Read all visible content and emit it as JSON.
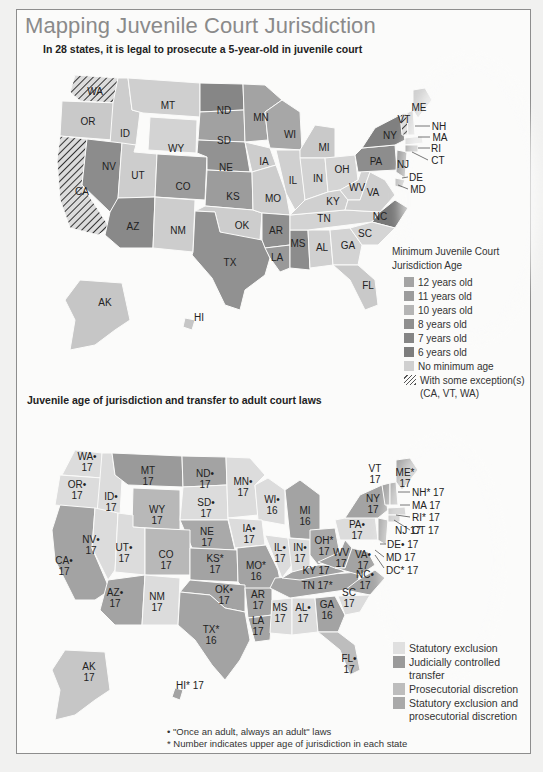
{
  "title": "Mapping Juvenile Court Jurisdiction",
  "map1": {
    "subtitle": "In 28 states, it is legal to prosecute a 5-year-old in juvenile court",
    "legend": {
      "title_line1": "Minimum Juvenile Court",
      "title_line2": "Jurisdiction Age",
      "items": [
        {
          "label": "12 years old",
          "color": "#a4a4a4"
        },
        {
          "label": "11 years old",
          "color": "#9c9c9c"
        },
        {
          "label": "10 years old",
          "color": "#b5b5b5"
        },
        {
          "label": "8 years old",
          "color": "#8f8f8f"
        },
        {
          "label": "7 years old",
          "color": "#858585"
        },
        {
          "label": "6 years old",
          "color": "#7d7d7d"
        },
        {
          "label": "No minimum age",
          "color": "#d0d0d0"
        }
      ],
      "hatch_label": "With some exception(s)",
      "hatch_sub": "(CA, VT, WA)"
    },
    "states": [
      {
        "abbr": "WA",
        "x": 95,
        "y": 91
      },
      {
        "abbr": "OR",
        "x": 88,
        "y": 121
      },
      {
        "abbr": "ID",
        "x": 125,
        "y": 133
      },
      {
        "abbr": "MT",
        "x": 168,
        "y": 105
      },
      {
        "abbr": "WY",
        "x": 176,
        "y": 148
      },
      {
        "abbr": "ND",
        "x": 224,
        "y": 110
      },
      {
        "abbr": "SD",
        "x": 224,
        "y": 140
      },
      {
        "abbr": "NE",
        "x": 226,
        "y": 167
      },
      {
        "abbr": "MN",
        "x": 261,
        "y": 117
      },
      {
        "abbr": "WI",
        "x": 290,
        "y": 134
      },
      {
        "abbr": "IA",
        "x": 264,
        "y": 161
      },
      {
        "abbr": "IL",
        "x": 293,
        "y": 180
      },
      {
        "abbr": "MI",
        "x": 324,
        "y": 147
      },
      {
        "abbr": "IN",
        "x": 318,
        "y": 178
      },
      {
        "abbr": "OH",
        "x": 342,
        "y": 169
      },
      {
        "abbr": "NV",
        "x": 109,
        "y": 166
      },
      {
        "abbr": "UT",
        "x": 138,
        "y": 175
      },
      {
        "abbr": "CO",
        "x": 183,
        "y": 186
      },
      {
        "abbr": "KS",
        "x": 233,
        "y": 196
      },
      {
        "abbr": "MO",
        "x": 273,
        "y": 198
      },
      {
        "abbr": "CA",
        "x": 82,
        "y": 191
      },
      {
        "abbr": "AZ",
        "x": 133,
        "y": 226
      },
      {
        "abbr": "NM",
        "x": 178,
        "y": 230
      },
      {
        "abbr": "OK",
        "x": 242,
        "y": 225
      },
      {
        "abbr": "AR",
        "x": 276,
        "y": 230
      },
      {
        "abbr": "TX",
        "x": 230,
        "y": 262
      },
      {
        "abbr": "LA",
        "x": 277,
        "y": 257
      },
      {
        "abbr": "MS",
        "x": 298,
        "y": 243
      },
      {
        "abbr": "AL",
        "x": 322,
        "y": 247
      },
      {
        "abbr": "GA",
        "x": 348,
        "y": 245
      },
      {
        "abbr": "TN",
        "x": 324,
        "y": 218
      },
      {
        "abbr": "KY",
        "x": 333,
        "y": 201
      },
      {
        "abbr": "WV",
        "x": 357,
        "y": 187
      },
      {
        "abbr": "VA",
        "x": 373,
        "y": 192
      },
      {
        "abbr": "NC",
        "x": 380,
        "y": 216
      },
      {
        "abbr": "SC",
        "x": 365,
        "y": 233
      },
      {
        "abbr": "FL",
        "x": 368,
        "y": 285
      },
      {
        "abbr": "PA",
        "x": 376,
        "y": 161
      },
      {
        "abbr": "NY",
        "x": 390,
        "y": 135
      },
      {
        "abbr": "NJ",
        "x": 403,
        "y": 164
      },
      {
        "abbr": "ME",
        "x": 419,
        "y": 107
      },
      {
        "abbr": "VT",
        "x": 404,
        "y": 119
      },
      {
        "abbr": "NH",
        "x": 437,
        "y": 126
      },
      {
        "abbr": "MA",
        "x": 438,
        "y": 137
      },
      {
        "abbr": "RI",
        "x": 436,
        "y": 148
      },
      {
        "abbr": "CT",
        "x": 437,
        "y": 160
      },
      {
        "abbr": "DE",
        "x": 416,
        "y": 177
      },
      {
        "abbr": "MD",
        "x": 417,
        "y": 189
      },
      {
        "abbr": "AK",
        "x": 105,
        "y": 302
      },
      {
        "abbr": "HI",
        "x": 199,
        "y": 317
      }
    ]
  },
  "map2": {
    "subtitle": "Juvenile age of jurisdiction and transfer to adult court laws",
    "legend": [
      {
        "label": "Statutory exclusion",
        "color": "#e0e0e0"
      },
      {
        "label": "Judicially controlled transfer",
        "color": "#9a9a9a"
      },
      {
        "label": "Prosecutorial discretion",
        "color": "#bdbdbd"
      },
      {
        "label": "Statutory exclusion and prosecutorial discretion",
        "color": "#a9a9a9"
      }
    ],
    "states": [
      {
        "abbr": "WA•",
        "age": "17",
        "x": 87,
        "y": 462
      },
      {
        "abbr": "OR•",
        "age": "17",
        "x": 77,
        "y": 490
      },
      {
        "abbr": "ID•",
        "age": "17",
        "x": 111,
        "y": 502
      },
      {
        "abbr": "MT",
        "age": "17",
        "x": 148,
        "y": 476
      },
      {
        "abbr": "WY",
        "age": "17",
        "x": 157,
        "y": 515
      },
      {
        "abbr": "ND•",
        "age": "17",
        "x": 205,
        "y": 479
      },
      {
        "abbr": "SD•",
        "age": "17",
        "x": 206,
        "y": 508
      },
      {
        "abbr": "NE",
        "age": "17",
        "x": 207,
        "y": 537
      },
      {
        "abbr": "MN•",
        "age": "17",
        "x": 243,
        "y": 487
      },
      {
        "abbr": "WI•",
        "age": "16",
        "x": 272,
        "y": 505
      },
      {
        "abbr": "MI",
        "age": "16",
        "x": 305,
        "y": 516
      },
      {
        "abbr": "IA•",
        "age": "17",
        "x": 249,
        "y": 534
      },
      {
        "abbr": "IL•",
        "age": "17",
        "x": 280,
        "y": 553
      },
      {
        "abbr": "IN•",
        "age": "17",
        "x": 300,
        "y": 553
      },
      {
        "abbr": "OH*",
        "age": "17",
        "x": 324,
        "y": 546
      },
      {
        "abbr": "NV•",
        "age": "17",
        "x": 91,
        "y": 545
      },
      {
        "abbr": "UT•",
        "age": "17",
        "x": 124,
        "y": 553
      },
      {
        "abbr": "CO",
        "age": "17",
        "x": 166,
        "y": 560
      },
      {
        "abbr": "KS*",
        "age": "17",
        "x": 215,
        "y": 564
      },
      {
        "abbr": "MO*",
        "age": "16",
        "x": 256,
        "y": 571
      },
      {
        "abbr": "CA•",
        "age": "17",
        "x": 64,
        "y": 566
      },
      {
        "abbr": "AZ•",
        "age": "17",
        "x": 115,
        "y": 598
      },
      {
        "abbr": "NM",
        "age": "17",
        "x": 157,
        "y": 602
      },
      {
        "abbr": "OK•",
        "age": "17",
        "x": 224,
        "y": 595
      },
      {
        "abbr": "AR",
        "age": "17",
        "x": 258,
        "y": 600
      },
      {
        "abbr": "TX*",
        "age": "16",
        "x": 211,
        "y": 635
      },
      {
        "abbr": "LA",
        "age": "17",
        "x": 258,
        "y": 626
      },
      {
        "abbr": "MS",
        "age": "17",
        "x": 280,
        "y": 613
      },
      {
        "abbr": "AL•",
        "age": "17",
        "x": 303,
        "y": 613
      },
      {
        "abbr": "GA",
        "age": "16",
        "x": 327,
        "y": 610
      },
      {
        "abbr": "SC",
        "age": "17",
        "x": 349,
        "y": 598
      },
      {
        "abbr": "TN 17*",
        "age": "",
        "x": 317,
        "y": 585
      },
      {
        "abbr": "KY 17",
        "age": "",
        "x": 316,
        "y": 570
      },
      {
        "abbr": "WV",
        "age": "17",
        "x": 341,
        "y": 558
      },
      {
        "abbr": "VA•",
        "age": "17",
        "x": 363,
        "y": 560
      },
      {
        "abbr": "NC•",
        "age": "17",
        "x": 365,
        "y": 580
      },
      {
        "abbr": "PA•",
        "age": "17",
        "x": 357,
        "y": 530
      },
      {
        "abbr": "NY",
        "age": "17",
        "x": 373,
        "y": 504
      },
      {
        "abbr": "VT",
        "age": "17",
        "x": 375,
        "y": 474
      },
      {
        "abbr": "ME*",
        "age": "17",
        "x": 405,
        "y": 478
      },
      {
        "abbr": "FL•",
        "age": "17",
        "x": 349,
        "y": 664
      },
      {
        "abbr": "AK",
        "age": "17",
        "x": 89,
        "y": 672
      },
      {
        "abbr": "HI* 17",
        "age": "",
        "x": 190,
        "y": 685
      }
    ],
    "callouts": [
      {
        "text": "NJ 17",
        "x": 395,
        "y": 530
      },
      {
        "text": "NH* 17",
        "x": 417,
        "y": 492
      },
      {
        "text": "MA 17",
        "x": 417,
        "y": 505
      },
      {
        "text": "RI* 17",
        "x": 417,
        "y": 517
      },
      {
        "text": "CT 17",
        "x": 417,
        "y": 530
      },
      {
        "text": "DE• 17",
        "x": 393,
        "y": 544
      },
      {
        "text": "MD 17",
        "x": 391,
        "y": 557
      },
      {
        "text": "DC* 17",
        "x": 391,
        "y": 570
      }
    ],
    "notes": [
      "• \"Once an adult, always an adult\" laws",
      "* Number indicates upper age of jurisdiction in each state"
    ]
  }
}
